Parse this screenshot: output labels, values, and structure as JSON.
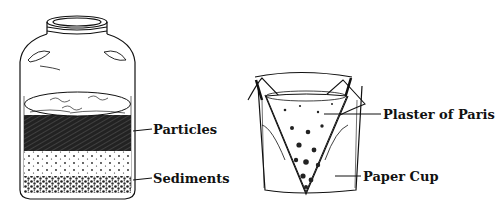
{
  "diagram": {
    "colors": {
      "ink": "#111111",
      "background": "#ffffff"
    },
    "jar": {
      "name": "Glass jar with settled layers",
      "labels": [
        {
          "id": "particles",
          "text": "Particles"
        },
        {
          "id": "sediments",
          "text": "Sediments"
        }
      ]
    },
    "cup": {
      "name": "Paper cup filter with plaster of Paris",
      "labels": [
        {
          "id": "plaster",
          "text": "Plaster of Paris"
        },
        {
          "id": "paper_cup",
          "text": "Paper Cup"
        }
      ]
    }
  }
}
